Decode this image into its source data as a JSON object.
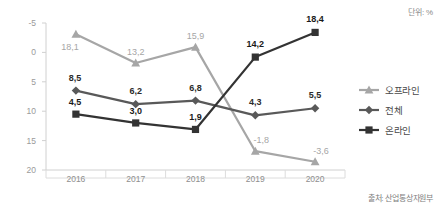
{
  "unit_note": "단위: %",
  "source_note": "출처: 산업통상자원부",
  "legend": {
    "items": [
      {
        "label": "오프라인",
        "marker": "triangle-marker",
        "color": "#a6a6a6"
      },
      {
        "label": "전체",
        "marker": "diamond-marker",
        "color": "#595959"
      },
      {
        "label": "온라인",
        "marker": "square-marker",
        "color": "#333333"
      }
    ]
  },
  "axes": {
    "yticks": [
      "20",
      "15",
      "10",
      "5",
      "0",
      "-5"
    ],
    "xticks": [
      "2016",
      "2017",
      "2018",
      "2019",
      "2020"
    ]
  },
  "labels": {
    "offline": [
      "18,1",
      "13,2",
      "15,9",
      "-1,8",
      "-3,6"
    ],
    "total": [
      "8,5",
      "6,2",
      "6,8",
      "4,3",
      "5,5"
    ],
    "online": [
      "4,5",
      "3,0",
      "1,9",
      "14,2",
      "18,4"
    ]
  },
  "chart_data": {
    "type": "line",
    "title": "",
    "subtitle": "",
    "xlabel": "",
    "ylabel": "",
    "unit": "%",
    "source": "출처: 산업통상자원부",
    "categories": [
      "2016",
      "2017",
      "2018",
      "2019",
      "2020"
    ],
    "ylim": [
      -5,
      20
    ],
    "yticks": [
      -5,
      0,
      5,
      10,
      15,
      20
    ],
    "grid": false,
    "legend_position": "right",
    "series": [
      {
        "name": "오프라인",
        "marker": "triangle",
        "color": "#a6a6a6",
        "values": [
          18.1,
          13.2,
          15.9,
          -1.8,
          -3.6
        ],
        "labels": [
          "18,1",
          "13,2",
          "15,9",
          "-1,8",
          "-3,6"
        ],
        "label_color": "#a6a6a6",
        "label_bold": false
      },
      {
        "name": "전체",
        "marker": "diamond",
        "color": "#595959",
        "values": [
          8.5,
          6.2,
          6.8,
          4.3,
          5.5
        ],
        "labels": [
          "8,5",
          "6,2",
          "6,8",
          "4,3",
          "5,5"
        ],
        "label_color": "#2b2b2b",
        "label_bold": true
      },
      {
        "name": "온라인",
        "marker": "square",
        "color": "#333333",
        "values": [
          4.5,
          3.0,
          1.9,
          14.2,
          18.4
        ],
        "labels": [
          "4,5",
          "3,0",
          "1,9",
          "14,2",
          "18,4"
        ],
        "label_color": "#1a1a1a",
        "label_bold": true
      }
    ]
  }
}
